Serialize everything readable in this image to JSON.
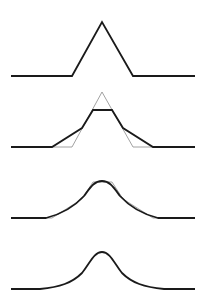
{
  "figure": {
    "background": "#ffffff",
    "stroke_color": "#1a1a1a",
    "guide_color": "#8a8a8a",
    "panels": [
      {
        "name": "original-triangle",
        "main_path": "M11,76 L72,76 L102,22 L133,76 L195,76"
      },
      {
        "name": "first-cut",
        "guide_path": "M52,147 L72,147 L102,92 L133,147 L153,147",
        "main_path": "M11,147 L52,147 L82,128 L93,110 L112,110 L123,128 L153,147 L195,147"
      },
      {
        "name": "second-cut",
        "guide_path": "M45,218 L52,218 L82,199 L93,182 L112,182 L123,199 L153,218 L160,218",
        "main_path": "M11,218 L46,218 C62,214 74,207 84,196 C90,188 94,181 102,181 C110,181 114,188 120,196 C130,207 142,214 158,218 L195,218"
      },
      {
        "name": "smooth-curve",
        "main_path": "M11,289 L40,289 C60,287 72,283 82,273 C90,263 94,252 102,252 C110,252 114,263 122,273 C132,283 144,287 164,289 L195,289"
      }
    ]
  }
}
